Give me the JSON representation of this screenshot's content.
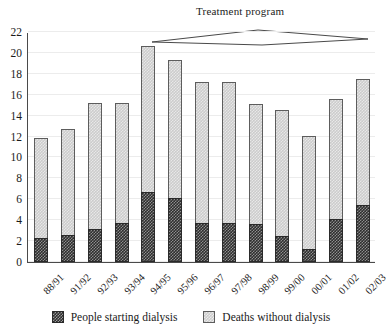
{
  "chart_data": {
    "type": "bar",
    "stacked": true,
    "title": "",
    "xlabel": "",
    "ylabel": "",
    "ylim": [
      0,
      22
    ],
    "ytick_step": 2,
    "yticks": [
      0,
      2,
      4,
      6,
      8,
      10,
      12,
      14,
      16,
      18,
      20,
      22
    ],
    "grid": true,
    "grid_axis": "y",
    "legend_position": "bottom",
    "categories": [
      "88/91",
      "91/92",
      "92/93",
      "93/94",
      "94/95",
      "95/96",
      "96/97",
      "97/98",
      "98/99",
      "99/00",
      "00/01",
      "01/02",
      "02/03"
    ],
    "series": [
      {
        "name": "People starting dialysis",
        "color": "#2e2e2e",
        "pattern": "dense-checker",
        "values": [
          2.3,
          2.6,
          3.2,
          3.7,
          6.7,
          6.1,
          3.7,
          3.7,
          3.6,
          2.5,
          1.2,
          4.1,
          5.5
        ]
      },
      {
        "name": "Deaths without dialysis",
        "color": "#cccccc",
        "pattern": "light-checker",
        "values": [
          9.6,
          10.1,
          12.0,
          11.5,
          14.0,
          13.2,
          13.5,
          13.5,
          11.5,
          12.0,
          10.9,
          11.5,
          12.0
        ]
      }
    ],
    "totals": [
      11.9,
      12.7,
      15.2,
      15.2,
      20.7,
      19.3,
      17.2,
      17.2,
      15.1,
      14.5,
      12.1,
      15.6,
      17.5
    ],
    "annotations": [
      {
        "name": "treatment-program",
        "label": "Treatment program",
        "shape": "horizontal-lens-bracket",
        "span_categories": [
          "94/95",
          "02/03"
        ]
      }
    ]
  },
  "legend": {
    "items": [
      {
        "label": "People starting dialysis",
        "swatch": "dark-checker-swatch"
      },
      {
        "label": "Deaths without dialysis",
        "swatch": "light-checker-swatch"
      }
    ]
  }
}
